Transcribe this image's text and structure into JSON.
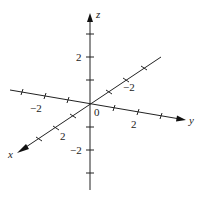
{
  "diagram": {
    "type": "3d-coordinate-axes",
    "origin_label": "0",
    "axes": {
      "x": {
        "label": "x",
        "positive_tick_label": "2",
        "negative_tick_label": "−2"
      },
      "y": {
        "label": "y",
        "positive_tick_label": "2",
        "negative_tick_label": "−2"
      },
      "z": {
        "label": "z",
        "positive_tick_label": "2",
        "negative_tick_label": "−2"
      }
    },
    "colors": {
      "line": "#222222",
      "background": "#ffffff"
    }
  }
}
